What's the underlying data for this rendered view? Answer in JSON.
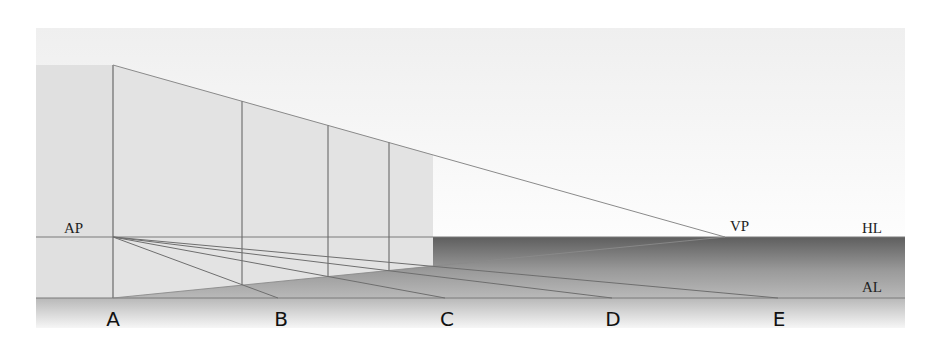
{
  "diagram": {
    "labels": {
      "ap": "AP",
      "vp": "VP",
      "hl": "HL",
      "al": "AL",
      "points": [
        "A",
        "B",
        "C",
        "D",
        "E"
      ]
    },
    "colors": {
      "sky_top": "#f0f0f0",
      "sky_bottom": "#fdfdfd",
      "wall": "#e2e2e2",
      "wall_edge": "#dcdcdc",
      "line": "#6e6e6e",
      "ground_dark": "#6a6a6a",
      "ground_mid": "#a8a8a8",
      "ground_light": "#b8b8b8",
      "strip_top": "#bdbdbd",
      "strip_bottom": "#f4f4f4"
    },
    "geometry": {
      "frame": {
        "x0": 36,
        "y0": 28,
        "x1": 905,
        "y1": 328
      },
      "horizon_y": 237,
      "al_y": 298,
      "ap": [
        113,
        237
      ],
      "vp": [
        725,
        237
      ],
      "wall_left_x": 36,
      "wall_top_y": 65,
      "near_edge_x": 113,
      "wall_right_x": 433,
      "verticals_x": [
        242,
        328,
        389
      ],
      "point_x": [
        113,
        278,
        445,
        612,
        778
      ]
    }
  }
}
